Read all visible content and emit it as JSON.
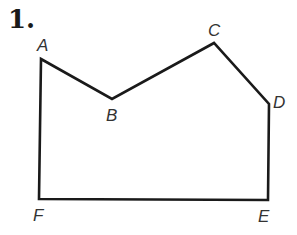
{
  "problem": {
    "number": "1."
  },
  "polygon": {
    "stroke_color": "#1a1a1a",
    "vertices": [
      {
        "name": "A",
        "x": 41,
        "y": 59,
        "label_x": 37,
        "label_y": 51
      },
      {
        "name": "B",
        "x": 112,
        "y": 99,
        "label_x": 106,
        "label_y": 121
      },
      {
        "name": "C",
        "x": 214,
        "y": 43,
        "label_x": 208,
        "label_y": 36
      },
      {
        "name": "D",
        "x": 269,
        "y": 104,
        "label_x": 273,
        "label_y": 108
      },
      {
        "name": "E",
        "x": 268,
        "y": 200,
        "label_x": 258,
        "label_y": 222
      },
      {
        "name": "F",
        "x": 39,
        "y": 199,
        "label_x": 33,
        "label_y": 221
      }
    ]
  }
}
